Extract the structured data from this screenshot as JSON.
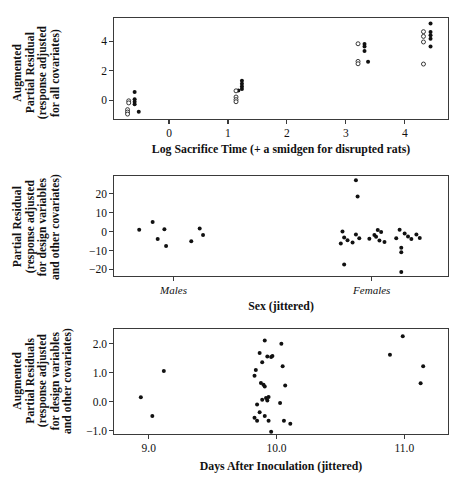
{
  "figure": {
    "title": "",
    "panel_count": 3
  },
  "chart_data": [
    {
      "type": "scatter",
      "panel_index": 0,
      "title": "",
      "xlabel": "Log Sacrifice Time (+ a smidgen for disrupted rats)",
      "ylabel": "Augmented Partial Residual (response adjusted for all covariates)",
      "ylabel_lines": [
        "Augmented",
        "Partial Residual",
        "(response adjusted",
        "for all covariates)"
      ],
      "xlim": [
        -0.95,
        4.75
      ],
      "ylim": [
        -1.35,
        5.65
      ],
      "xticks": [
        0,
        1,
        2,
        3,
        4
      ],
      "xticklabels": [
        "0",
        "1",
        "2",
        "3",
        "4"
      ],
      "yticks": [
        0,
        2,
        4
      ],
      "yticklabels": [
        "0",
        "2",
        "4"
      ],
      "grid": false,
      "legend": null,
      "series": [
        {
          "name": "filled",
          "marker": "filled-circle",
          "points": [
            [
              -0.6,
              0.62
            ],
            [
              -0.6,
              0.12
            ],
            [
              -0.6,
              -0.05
            ],
            [
              -0.6,
              -0.22
            ],
            [
              -0.53,
              -0.72
            ],
            [
              1.22,
              1.38
            ],
            [
              1.22,
              1.18
            ],
            [
              1.22,
              1.0
            ],
            [
              1.22,
              0.82
            ],
            [
              1.16,
              0.72
            ],
            [
              3.3,
              3.88
            ],
            [
              3.3,
              3.72
            ],
            [
              3.3,
              3.4
            ],
            [
              3.36,
              2.68
            ],
            [
              4.42,
              5.28
            ],
            [
              4.42,
              4.7
            ],
            [
              4.42,
              4.48
            ],
            [
              4.42,
              4.24
            ],
            [
              4.42,
              3.72
            ]
          ]
        },
        {
          "name": "open",
          "marker": "open-circle",
          "points": [
            [
              -0.7,
              0.02
            ],
            [
              -0.7,
              -0.12
            ],
            [
              -0.72,
              -0.58
            ],
            [
              -0.72,
              -0.74
            ],
            [
              -0.72,
              -0.88
            ],
            [
              1.12,
              0.7
            ],
            [
              1.12,
              0.28
            ],
            [
              1.12,
              0.1
            ],
            [
              1.12,
              -0.04
            ],
            [
              3.19,
              3.9
            ],
            [
              3.19,
              2.7
            ],
            [
              3.19,
              2.54
            ],
            [
              4.3,
              4.72
            ],
            [
              4.3,
              4.4
            ],
            [
              4.3,
              4.02
            ],
            [
              4.3,
              2.52
            ]
          ]
        }
      ]
    },
    {
      "type": "scatter",
      "panel_index": 1,
      "title": "",
      "xlabel": "Sex (jittered)",
      "ylabel": "Partial Residual (response adjusted for design variables and other covariates)",
      "ylabel_lines": [
        "Partial Residual",
        "(response adjusted",
        "for design variables",
        "and other covariates)"
      ],
      "xlim": [
        0,
        100
      ],
      "ylim": [
        -24,
        30
      ],
      "xticks": [
        18,
        77
      ],
      "xticklabels": [
        "Males",
        "Females"
      ],
      "yticks": [
        -20,
        -10,
        0,
        10,
        20
      ],
      "yticklabels": [
        "−20",
        "−10",
        "0",
        "10",
        "20"
      ],
      "grid": false,
      "legend": null,
      "series": [
        {
          "name": "residuals",
          "marker": "filled-circle",
          "points": [
            [
              7.5,
              1.6
            ],
            [
              11.5,
              5.6
            ],
            [
              15.0,
              1.8
            ],
            [
              13.0,
              -3.4
            ],
            [
              15.5,
              -7.0
            ],
            [
              25.5,
              2.2
            ],
            [
              26.5,
              -1.2
            ],
            [
              23.0,
              -4.6
            ],
            [
              72.0,
              27.8
            ],
            [
              72.5,
              19.2
            ],
            [
              68.0,
              0.6
            ],
            [
              68.5,
              -2.6
            ],
            [
              69.5,
              -4.0
            ],
            [
              67.5,
              -5.8
            ],
            [
              72.0,
              -1.0
            ],
            [
              73.0,
              -3.0
            ],
            [
              71.0,
              -5.2
            ],
            [
              76.0,
              -3.2
            ],
            [
              77.5,
              -1.2
            ],
            [
              78.5,
              1.4
            ],
            [
              79.5,
              0.4
            ],
            [
              78.0,
              -2.2
            ],
            [
              79.0,
              -4.2
            ],
            [
              80.5,
              -5.0
            ],
            [
              85.0,
              1.6
            ],
            [
              86.5,
              -0.4
            ],
            [
              84.0,
              -3.0
            ],
            [
              87.5,
              -2.0
            ],
            [
              88.5,
              -3.4
            ],
            [
              85.5,
              -8.0
            ],
            [
              85.5,
              -10.4
            ],
            [
              91.0,
              -2.8
            ],
            [
              90.0,
              -1.0
            ],
            [
              68.5,
              -16.8
            ],
            [
              85.5,
              -20.8
            ]
          ]
        }
      ]
    },
    {
      "type": "scatter",
      "panel_index": 2,
      "title": "",
      "xlabel": "Days After Inoculation (jittered)",
      "ylabel": "Augmented Partial Residuals (response adjusted for design variables and other covariates)",
      "ylabel_lines": [
        "Augmented",
        "Partial Residuals",
        "(response adjusted",
        "for design variables",
        "and other covariates)"
      ],
      "xlim": [
        8.72,
        11.35
      ],
      "ylim": [
        -1.15,
        2.55
      ],
      "xticks": [
        9.0,
        10.0,
        11.0
      ],
      "xticklabels": [
        "9.0",
        "10.0",
        "11.0"
      ],
      "yticks": [
        -1.0,
        0.0,
        1.0,
        2.0
      ],
      "yticklabels": [
        "−1.0",
        "0.0",
        "1.0",
        "2.0"
      ],
      "grid": false,
      "legend": null,
      "series": [
        {
          "name": "residuals",
          "marker": "filled-circle",
          "points": [
            [
              8.93,
              0.19
            ],
            [
              9.02,
              -0.46
            ],
            [
              9.11,
              1.1
            ],
            [
              9.82,
              0.93
            ],
            [
              9.83,
              1.13
            ],
            [
              9.86,
              1.72
            ],
            [
              9.9,
              2.15
            ],
            [
              9.92,
              1.6
            ],
            [
              9.95,
              1.58
            ],
            [
              9.96,
              1.62
            ],
            [
              9.88,
              1.4
            ],
            [
              9.87,
              0.68
            ],
            [
              9.89,
              0.62
            ],
            [
              9.9,
              0.56
            ],
            [
              9.88,
              0.1
            ],
            [
              9.91,
              0.16
            ],
            [
              9.92,
              0.08
            ],
            [
              9.93,
              0.2
            ],
            [
              9.84,
              -0.06
            ],
            [
              9.86,
              -0.33
            ],
            [
              9.82,
              -0.52
            ],
            [
              9.84,
              -0.62
            ],
            [
              9.9,
              -0.46
            ],
            [
              9.93,
              -0.62
            ],
            [
              9.95,
              -1.0
            ],
            [
              10.03,
              2.04
            ],
            [
              10.04,
              1.26
            ],
            [
              10.06,
              0.6
            ],
            [
              10.02,
              -0.01
            ],
            [
              10.05,
              -0.62
            ],
            [
              10.1,
              -0.73
            ],
            [
              10.88,
              1.66
            ],
            [
              10.98,
              2.3
            ],
            [
              11.14,
              1.26
            ],
            [
              11.12,
              0.67
            ]
          ]
        }
      ]
    }
  ]
}
